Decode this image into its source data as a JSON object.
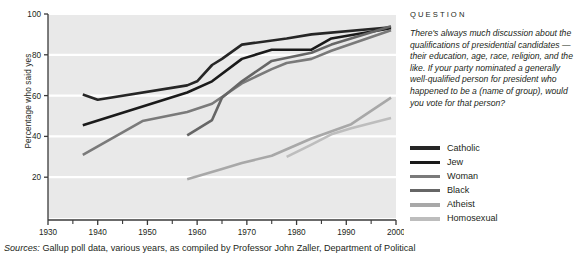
{
  "chart_data": {
    "type": "line",
    "title": "",
    "xlabel": "",
    "ylabel": "Percentage who said yes",
    "xlim": [
      1930,
      2000
    ],
    "ylim": [
      0,
      100
    ],
    "xticks": [
      1930,
      1940,
      1950,
      1960,
      1970,
      1980,
      1990,
      2000
    ],
    "xtick_labels": [
      "1930",
      "1940",
      "1950",
      "1960",
      "1970",
      "1980",
      "1990",
      "2000"
    ],
    "yticks": [
      20,
      40,
      60,
      80,
      100
    ],
    "ytick_labels": [
      "20",
      "40",
      "60",
      "80",
      "100"
    ],
    "grid": "horizontal-white",
    "legend_position": "right",
    "plot_background": "#e9e9e9",
    "series": [
      {
        "name": "Catholic",
        "color": "#262626",
        "points": [
          [
            1937,
            60.5
          ],
          [
            1940,
            58.0
          ],
          [
            1958,
            65.0
          ],
          [
            1960,
            67.0
          ],
          [
            1963,
            75.0
          ],
          [
            1965,
            78.0
          ],
          [
            1969,
            85.0
          ],
          [
            1978,
            88.0
          ],
          [
            1983,
            90.0
          ],
          [
            1999,
            93.5
          ]
        ]
      },
      {
        "name": "Jew",
        "color": "#1a1a1a",
        "points": [
          [
            1937,
            45.5
          ],
          [
            1958,
            61.5
          ],
          [
            1963,
            67.0
          ],
          [
            1969,
            78.0
          ],
          [
            1975,
            82.5
          ],
          [
            1983,
            82.5
          ],
          [
            1987,
            88.0
          ],
          [
            1999,
            93.0
          ]
        ]
      },
      {
        "name": "Woman",
        "color": "#7a7a7a",
        "points": [
          [
            1937,
            31.0
          ],
          [
            1949,
            47.5
          ],
          [
            1958,
            52.0
          ],
          [
            1963,
            56.0
          ],
          [
            1969,
            66.0
          ],
          [
            1975,
            73.0
          ],
          [
            1978,
            76.0
          ],
          [
            1983,
            78.0
          ],
          [
            1987,
            82.0
          ],
          [
            1999,
            92.0
          ]
        ]
      },
      {
        "name": "Black",
        "color": "#666666",
        "points": [
          [
            1958,
            40.5
          ],
          [
            1963,
            48.0
          ],
          [
            1965,
            59.0
          ],
          [
            1969,
            67.0
          ],
          [
            1975,
            77.0
          ],
          [
            1983,
            81.0
          ],
          [
            1987,
            85.0
          ],
          [
            1999,
            94.0
          ]
        ]
      },
      {
        "name": "Atheist",
        "color": "#a8a8a8",
        "points": [
          [
            1958,
            19.0
          ],
          [
            1965,
            24.0
          ],
          [
            1969,
            27.0
          ],
          [
            1975,
            30.5
          ],
          [
            1983,
            39.0
          ],
          [
            1991,
            46.0
          ],
          [
            1999,
            59.0
          ]
        ]
      },
      {
        "name": "Homosexual",
        "color": "#bdbdbd",
        "points": [
          [
            1978,
            30.0
          ],
          [
            1983,
            36.0
          ],
          [
            1987,
            41.0
          ],
          [
            1991,
            44.0
          ],
          [
            1999,
            49.0
          ]
        ]
      }
    ]
  },
  "question": {
    "heading": "QUESTION",
    "body": "There's always much discussion about the qualifications of presidential candidates — their education, age, race, religion, and the like. If your party nominated a generally well-qualified person for president who happened to be a (name of group), would you vote for that person?"
  },
  "legend": {
    "items": [
      {
        "label": "Catholic",
        "color": "#262626"
      },
      {
        "label": "Jew",
        "color": "#1a1a1a"
      },
      {
        "label": "Woman",
        "color": "#7a7a7a"
      },
      {
        "label": "Black",
        "color": "#666666"
      },
      {
        "label": "Atheist",
        "color": "#a8a8a8"
      },
      {
        "label": "Homosexual",
        "color": "#bdbdbd"
      }
    ]
  },
  "source": {
    "label": "Sources:",
    "text": " Gallup poll data, various years, as compiled by Professor John Zaller, Department of Political"
  }
}
